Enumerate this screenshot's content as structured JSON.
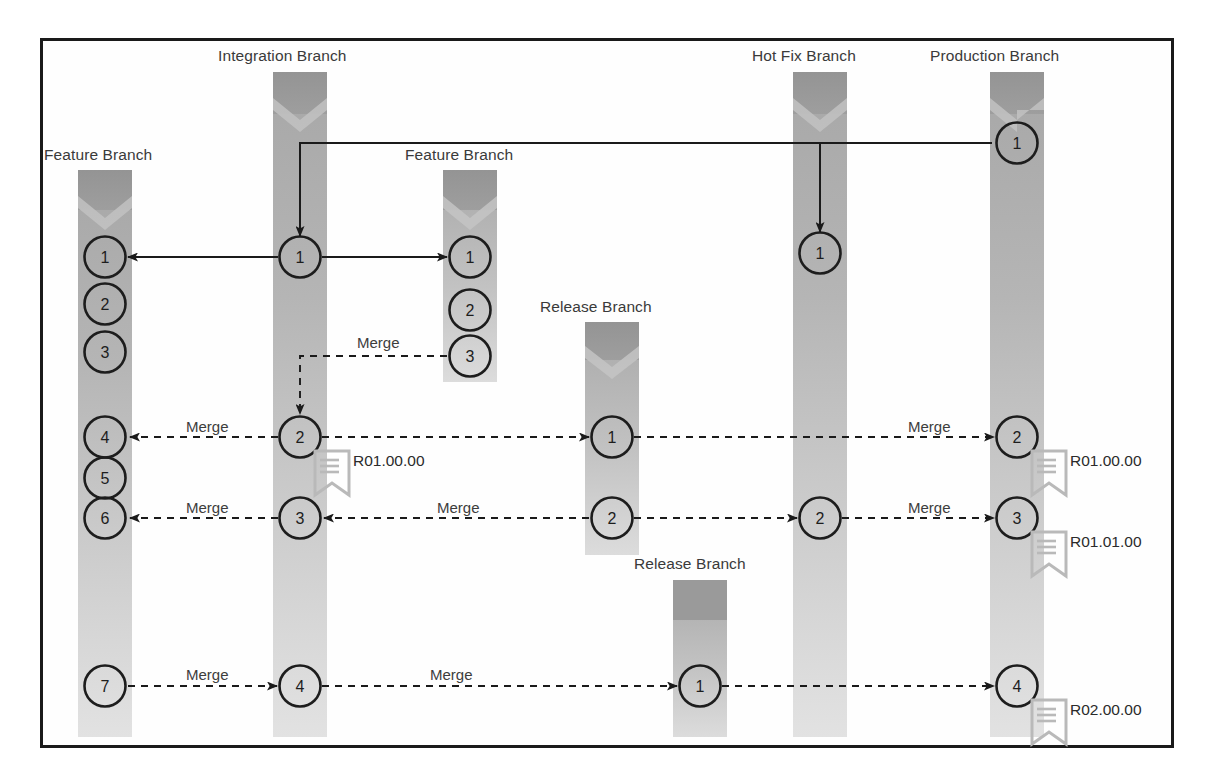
{
  "diagram": {
    "frame": {
      "border_color": "#1a1a1a",
      "background": "#fefefe"
    },
    "colors": {
      "bar_top": "#9a9a9a",
      "bar_body": "#b4b4b4",
      "bar_fade": "#dcdcdc",
      "node_stroke": "#1d1d1d",
      "node_fill": "none",
      "arrow": "#1a1a1a",
      "text": "#3a3a3a",
      "tag_outline": "#b9b9b9"
    }
  },
  "branches": [
    {
      "id": "feature1",
      "label": "Feature Branch",
      "x": 105,
      "label_x": 44,
      "label_y": 146,
      "top": 170,
      "bottom": 737,
      "nodes": [
        "1",
        "2",
        "3",
        "4",
        "5",
        "6",
        "7"
      ]
    },
    {
      "id": "integration",
      "label": "Integration Branch",
      "x": 300,
      "label_x": 218,
      "label_y": 47,
      "top": 72,
      "bottom": 737,
      "nodes": [
        "1",
        "2",
        "3",
        "4"
      ]
    },
    {
      "id": "feature2",
      "label": "Feature Branch",
      "x": 470,
      "label_x": 405,
      "label_y": 146,
      "top": 170,
      "bottom": 382,
      "nodes": [
        "1",
        "2",
        "3"
      ]
    },
    {
      "id": "release1",
      "label": "Release Branch",
      "x": 612,
      "label_x": 540,
      "label_y": 298,
      "top": 322,
      "bottom": 555,
      "nodes": [
        "1",
        "2"
      ]
    },
    {
      "id": "hotfix",
      "label": "Hot Fix Branch",
      "x": 820,
      "label_x": 752,
      "label_y": 47,
      "top": 72,
      "bottom": 737,
      "nodes": [
        "1",
        "2"
      ]
    },
    {
      "id": "production",
      "label": "Production Branch",
      "x": 1017,
      "label_x": 930,
      "label_y": 47,
      "top": 72,
      "bottom": 737,
      "nodes": [
        "1",
        "2",
        "3",
        "4"
      ]
    },
    {
      "id": "release2",
      "label": "Release Branch",
      "x": 700,
      "label_x": 634,
      "label_y": 555,
      "top": 580,
      "bottom": 737,
      "nodes": [
        "1"
      ]
    }
  ],
  "rows": {
    "r_create": 257,
    "r_merge1": 437,
    "r_merge2": 518,
    "r_merge3": 686,
    "feature2_n3": 356,
    "prod_n1": 143,
    "hotfix_n1": 253,
    "release1_n1": 437,
    "release1_n2": 518,
    "release2_n1": 686
  },
  "nodes": [
    {
      "branch": "feature1",
      "label": "1",
      "x": 105,
      "y": 257
    },
    {
      "branch": "feature1",
      "label": "2",
      "x": 105,
      "y": 304
    },
    {
      "branch": "feature1",
      "label": "3",
      "x": 105,
      "y": 352
    },
    {
      "branch": "feature1",
      "label": "4",
      "x": 105,
      "y": 437
    },
    {
      "branch": "feature1",
      "label": "5",
      "x": 105,
      "y": 478
    },
    {
      "branch": "feature1",
      "label": "6",
      "x": 105,
      "y": 518
    },
    {
      "branch": "feature1",
      "label": "7",
      "x": 105,
      "y": 686
    },
    {
      "branch": "integration",
      "label": "1",
      "x": 300,
      "y": 257
    },
    {
      "branch": "integration",
      "label": "2",
      "x": 300,
      "y": 437
    },
    {
      "branch": "integration",
      "label": "3",
      "x": 300,
      "y": 518
    },
    {
      "branch": "integration",
      "label": "4",
      "x": 300,
      "y": 686
    },
    {
      "branch": "feature2",
      "label": "1",
      "x": 470,
      "y": 257
    },
    {
      "branch": "feature2",
      "label": "2",
      "x": 470,
      "y": 310
    },
    {
      "branch": "feature2",
      "label": "3",
      "x": 470,
      "y": 356
    },
    {
      "branch": "release1",
      "label": "1",
      "x": 612,
      "y": 437
    },
    {
      "branch": "release1",
      "label": "2",
      "x": 612,
      "y": 518
    },
    {
      "branch": "release2",
      "label": "1",
      "x": 700,
      "y": 686
    },
    {
      "branch": "hotfix",
      "label": "1",
      "x": 820,
      "y": 253
    },
    {
      "branch": "hotfix",
      "label": "2",
      "x": 820,
      "y": 518
    },
    {
      "branch": "production",
      "label": "1",
      "x": 1017,
      "y": 143
    },
    {
      "branch": "production",
      "label": "2",
      "x": 1017,
      "y": 437
    },
    {
      "branch": "production",
      "label": "3",
      "x": 1017,
      "y": 518
    },
    {
      "branch": "production",
      "label": "4",
      "x": 1017,
      "y": 686
    }
  ],
  "merge_labels": [
    {
      "text": "Merge",
      "x": 186,
      "y": 418
    },
    {
      "text": "Merge",
      "x": 186,
      "y": 499
    },
    {
      "text": "Merge",
      "x": 186,
      "y": 666
    },
    {
      "text": "Merge",
      "x": 357,
      "y": 334
    },
    {
      "text": "Merge",
      "x": 437,
      "y": 499
    },
    {
      "text": "Merge",
      "x": 430,
      "y": 666
    },
    {
      "text": "Merge",
      "x": 908,
      "y": 418
    },
    {
      "text": "Merge",
      "x": 908,
      "y": 499
    }
  ],
  "tags": [
    {
      "text": "R01.00.00",
      "icon": "tag-bookmark-icon",
      "x": 315,
      "y": 451
    },
    {
      "text": "R01.00.00",
      "icon": "tag-bookmark-icon",
      "x": 1032,
      "y": 451
    },
    {
      "text": "R01.01.00",
      "icon": "tag-bookmark-icon",
      "x": 1032,
      "y": 532
    },
    {
      "text": "R02.00.00",
      "icon": "tag-bookmark-icon",
      "x": 1032,
      "y": 700
    }
  ],
  "connections": [
    {
      "id": "prod1-to-integration1",
      "kind": "solid",
      "type": "branch-off",
      "from": "production.1",
      "to": "integration.1"
    },
    {
      "id": "prod1-to-hotfix",
      "kind": "solid",
      "type": "branch-off",
      "from": "production.1",
      "to": "hotfix.1"
    },
    {
      "id": "integration1-to-feature1",
      "kind": "solid",
      "type": "branch-off",
      "from": "integration.1",
      "to": "feature1.1"
    },
    {
      "id": "integration1-to-feature2",
      "kind": "solid",
      "type": "branch-off",
      "from": "integration.1",
      "to": "feature2.1"
    },
    {
      "id": "feature2-3-to-integration2",
      "kind": "dashed",
      "type": "merge",
      "from": "feature2.3",
      "to": "integration.2"
    },
    {
      "id": "integration2-to-feature1-4",
      "kind": "dashed",
      "type": "merge",
      "from": "integration.2",
      "to": "feature1.4"
    },
    {
      "id": "integration2-to-release1-1",
      "kind": "dashed",
      "type": "merge",
      "from": "integration.2",
      "to": "release1.1"
    },
    {
      "id": "release1-1-to-production2",
      "kind": "dashed",
      "type": "merge",
      "from": "release1.1",
      "to": "production.2"
    },
    {
      "id": "integration3-to-feature1-6",
      "kind": "dashed",
      "type": "merge",
      "from": "integration.3",
      "to": "feature1.6"
    },
    {
      "id": "release1-2-to-integration3",
      "kind": "dashed",
      "type": "merge",
      "from": "release1.2",
      "to": "integration.3"
    },
    {
      "id": "release1-2-to-hotfix2",
      "kind": "dashed",
      "type": "merge",
      "from": "release1.2",
      "to": "hotfix.2"
    },
    {
      "id": "hotfix2-to-production3",
      "kind": "dashed",
      "type": "merge",
      "from": "hotfix.2",
      "to": "production.3"
    },
    {
      "id": "feature1-7-to-integration4",
      "kind": "dashed",
      "type": "merge",
      "from": "feature1.7",
      "to": "integration.4"
    },
    {
      "id": "integration4-to-release2-1",
      "kind": "dashed",
      "type": "merge",
      "from": "integration.4",
      "to": "release2.1"
    },
    {
      "id": "release2-1-to-production4",
      "kind": "dashed",
      "type": "merge",
      "from": "release2.1",
      "to": "production.4"
    }
  ]
}
